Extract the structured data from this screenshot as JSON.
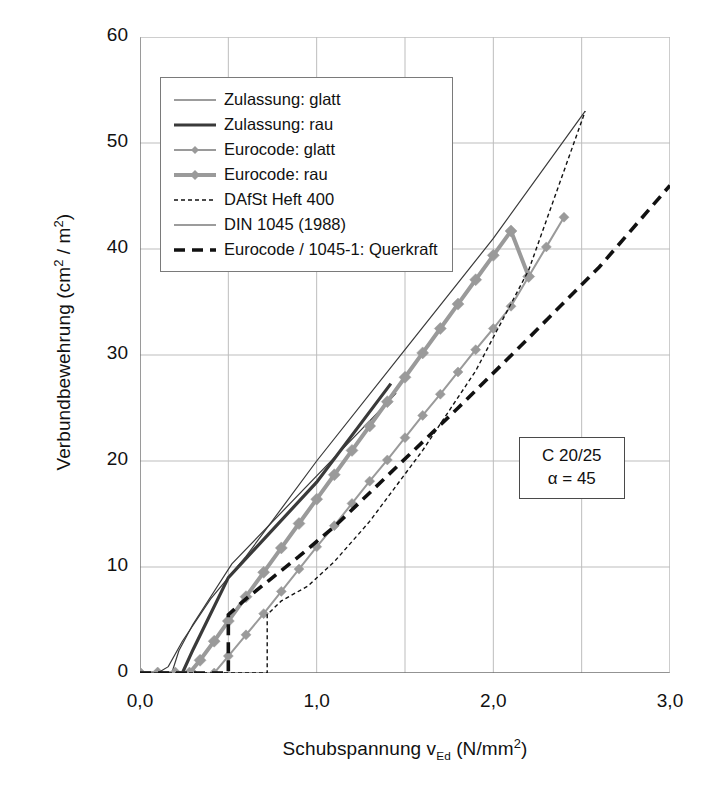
{
  "chart_data": {
    "type": "line",
    "title": "",
    "xlabel_parts": {
      "main": "Schubspannung v",
      "sub": "Ed",
      "unit": " (N/mm",
      "unit_sup": "2",
      "unit_end": ")"
    },
    "ylabel_parts": {
      "main": "Verbundbewehrung (cm",
      "sup1": "2",
      "mid": " / m",
      "sup2": "2",
      "end": ")"
    },
    "xlabel": "Schubspannung vEd (N/mm2)",
    "ylabel": "Verbundbewehrung (cm2 / m2)",
    "xlim": [
      0.0,
      3.0
    ],
    "ylim": [
      0,
      60
    ],
    "xticks": [
      0.0,
      1.0,
      2.0,
      3.0
    ],
    "xtick_labels": [
      "0,0",
      "1,0",
      "2,0",
      "3,0"
    ],
    "yticks": [
      0,
      10,
      20,
      30,
      40,
      50,
      60
    ],
    "ytick_labels": [
      "0",
      "10",
      "20",
      "30",
      "40",
      "50",
      "60"
    ],
    "x_minor_gridlines": [
      0.5,
      1.5,
      2.5
    ],
    "grid": true,
    "legend_position": "upper-left",
    "series": [
      {
        "name": "Zulassung: glatt",
        "style": "thin-solid",
        "color": "#3a3a3a",
        "points": [
          [
            0.0,
            0.0
          ],
          [
            0.18,
            0.0
          ],
          [
            0.22,
            2.1
          ],
          [
            0.3,
            4.6
          ],
          [
            0.52,
            10.3
          ],
          [
            1.4,
            25.5
          ],
          [
            1.45,
            26.4
          ]
        ]
      },
      {
        "name": "Zulassung: rau",
        "style": "thick-solid",
        "color": "#3a3a3a",
        "points": [
          [
            0.0,
            0.0
          ],
          [
            0.24,
            0.0
          ],
          [
            0.3,
            2.2
          ],
          [
            0.5,
            9.0
          ],
          [
            1.0,
            18.0
          ],
          [
            1.42,
            27.3
          ]
        ]
      },
      {
        "name": "Eurocode: glatt",
        "style": "marker-thin",
        "color": "#9a9a9a",
        "points": [
          [
            0.0,
            0.0
          ],
          [
            0.1,
            0.0
          ],
          [
            0.2,
            0.0
          ],
          [
            0.3,
            0.0
          ],
          [
            0.42,
            0.0
          ],
          [
            0.5,
            1.6
          ],
          [
            0.6,
            3.6
          ],
          [
            0.7,
            5.6
          ],
          [
            0.8,
            7.7
          ],
          [
            0.9,
            9.8
          ],
          [
            1.0,
            11.9
          ],
          [
            1.1,
            13.9
          ],
          [
            1.2,
            16.0
          ],
          [
            1.3,
            18.1
          ],
          [
            1.4,
            20.1
          ],
          [
            1.5,
            22.2
          ],
          [
            1.6,
            24.3
          ],
          [
            1.7,
            26.3
          ],
          [
            1.8,
            28.4
          ],
          [
            1.9,
            30.5
          ],
          [
            2.0,
            32.5
          ],
          [
            2.1,
            34.6
          ],
          [
            2.2,
            37.4
          ],
          [
            2.3,
            40.2
          ],
          [
            2.4,
            43.0
          ]
        ]
      },
      {
        "name": "Eurocode: rau",
        "style": "marker-thick",
        "color": "#9a9a9a",
        "points": [
          [
            0.0,
            0.0
          ],
          [
            0.1,
            0.0
          ],
          [
            0.2,
            0.0
          ],
          [
            0.28,
            0.0
          ],
          [
            0.34,
            1.2
          ],
          [
            0.42,
            3.0
          ],
          [
            0.5,
            4.9
          ],
          [
            0.6,
            7.2
          ],
          [
            0.7,
            9.5
          ],
          [
            0.8,
            11.8
          ],
          [
            0.9,
            14.1
          ],
          [
            1.0,
            16.4
          ],
          [
            1.1,
            18.7
          ],
          [
            1.2,
            21.0
          ],
          [
            1.3,
            23.3
          ],
          [
            1.4,
            25.6
          ],
          [
            1.5,
            27.9
          ],
          [
            1.6,
            30.2
          ],
          [
            1.7,
            32.5
          ],
          [
            1.8,
            34.8
          ],
          [
            1.9,
            37.1
          ],
          [
            2.0,
            39.4
          ],
          [
            2.1,
            41.7
          ],
          [
            2.2,
            37.4
          ]
        ]
      },
      {
        "name": "DAfSt Heft 400",
        "style": "fine-dash",
        "color": "#111111",
        "points": [
          [
            0.0,
            0.0
          ],
          [
            0.4,
            0.0
          ],
          [
            0.72,
            0.0
          ],
          [
            0.72,
            5.5
          ],
          [
            0.8,
            6.8
          ],
          [
            0.95,
            8.2
          ],
          [
            1.1,
            10.5
          ],
          [
            1.3,
            14.3
          ],
          [
            1.6,
            21.0
          ],
          [
            1.9,
            28.5
          ],
          [
            2.2,
            38.0
          ],
          [
            2.52,
            53.0
          ]
        ]
      },
      {
        "name": "DIN 1045 (1988)",
        "style": "thin-solid-2",
        "color": "#3a3a3a",
        "points": [
          [
            0.0,
            0.0
          ],
          [
            0.1,
            0.0
          ],
          [
            0.16,
            0.6
          ],
          [
            0.24,
            3.0
          ],
          [
            0.4,
            7.0
          ],
          [
            0.6,
            11.0
          ],
          [
            1.0,
            20.0
          ],
          [
            1.5,
            30.5
          ],
          [
            2.0,
            41.0
          ],
          [
            2.52,
            53.0
          ]
        ]
      },
      {
        "name": "Eurocode / 1045-1: Querkraft",
        "style": "bold-dash",
        "color": "#111111",
        "points": [
          [
            0.0,
            0.0
          ],
          [
            0.3,
            0.0
          ],
          [
            0.5,
            0.0
          ],
          [
            0.5,
            5.5
          ],
          [
            0.6,
            7.0
          ],
          [
            0.75,
            9.0
          ],
          [
            0.9,
            11.0
          ],
          [
            1.1,
            13.8
          ],
          [
            1.4,
            18.6
          ],
          [
            1.8,
            25.0
          ],
          [
            2.2,
            31.6
          ],
          [
            2.6,
            38.3
          ],
          [
            3.0,
            46.0
          ]
        ]
      }
    ],
    "annotation": {
      "line1": "C 20/25",
      "line2": "α = 45"
    }
  },
  "legend": {
    "items": [
      {
        "label": "Zulassung: glatt",
        "key": "thin-solid"
      },
      {
        "label": "Zulassung: rau",
        "key": "thick-solid"
      },
      {
        "label": "Eurocode: glatt",
        "key": "marker-thin"
      },
      {
        "label": "Eurocode: rau",
        "key": "marker-thick"
      },
      {
        "label": "DAfSt Heft 400",
        "key": "fine-dash"
      },
      {
        "label": "DIN 1045 (1988)",
        "key": "thin-solid-2"
      },
      {
        "label": "Eurocode / 1045-1: Querkraft",
        "key": "bold-dash"
      }
    ]
  },
  "colors": {
    "gray_series": "#9a9a9a",
    "dark_series": "#3a3a3a",
    "black_series": "#111111",
    "grid": "#bdbdbd",
    "axis": "#6f6f6f"
  }
}
